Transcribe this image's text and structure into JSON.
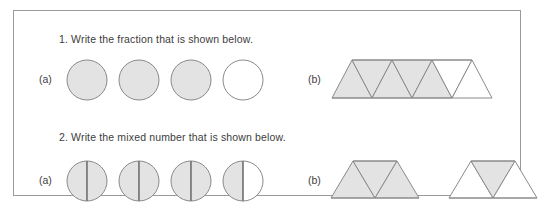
{
  "worksheet": {
    "border_color": "#9a9a9a",
    "background": "#ffffff",
    "shade_color": "#e3e3e3",
    "outline_color": "#8a8a8a",
    "text_color": "#3d3d3d"
  },
  "questions": [
    {
      "id": "q1",
      "text": "1. Write the fraction that is shown below.",
      "parts": [
        {
          "label": "(a)",
          "type": "circles",
          "count": 4,
          "shaded": [
            true,
            true,
            true,
            false
          ],
          "split": false
        },
        {
          "label": "(b)",
          "type": "triangle-strip",
          "count": 7,
          "shaded": [
            true,
            true,
            true,
            true,
            true,
            false,
            false
          ]
        }
      ]
    },
    {
      "id": "q2",
      "text": "2. Write the mixed number that is shown below.",
      "parts": [
        {
          "label": "(a)",
          "type": "circles",
          "count": 4,
          "split": true,
          "halves": [
            [
              true,
              true
            ],
            [
              true,
              true
            ],
            [
              true,
              true
            ],
            [
              true,
              false
            ]
          ]
        },
        {
          "label": "(b)",
          "type": "trapezoids",
          "count": 2,
          "shapes": [
            {
              "triangles_shaded": [
                true,
                true,
                true
              ]
            },
            {
              "triangles_shaded": [
                false,
                true,
                false
              ]
            }
          ]
        }
      ]
    }
  ]
}
